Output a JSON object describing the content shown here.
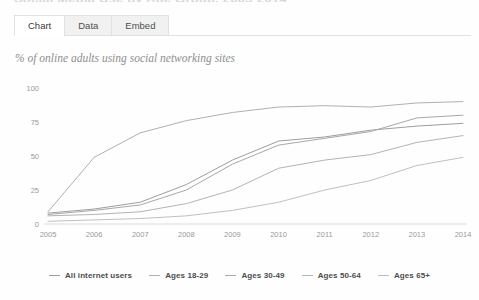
{
  "page": {
    "cut_off_title": "Social Media Use by Age Group, 2005-2014"
  },
  "tabs": [
    {
      "label": "Chart",
      "active": true,
      "name": "tab-chart"
    },
    {
      "label": "Data",
      "active": false,
      "name": "tab-data"
    },
    {
      "label": "Embed",
      "active": false,
      "name": "tab-embed"
    }
  ],
  "subtitle": "% of online adults using social networking sites",
  "colors": {
    "line_all": "#9e9e9e",
    "line_18_29": "#b0b0b0",
    "line_30_49": "#a8a8a8",
    "line_50_64": "#b4b4b4",
    "line_65plus": "#c0c0c0",
    "axis": "#dcdcdc",
    "tick_text": "#9a9a9a"
  },
  "chart_data": {
    "type": "line",
    "title": "",
    "subtitle": "% of online adults using social networking sites",
    "xlabel": "",
    "ylabel": "",
    "x": [
      2005,
      2006,
      2007,
      2008,
      2009,
      2010,
      2011,
      2012,
      2013,
      2014
    ],
    "xtick_labels": [
      "2005",
      "2006",
      "2007",
      "2008",
      "2009",
      "2010",
      "2011",
      "2012",
      "2013",
      "2014"
    ],
    "ytick_labels": [
      "0",
      "25",
      "50",
      "75",
      "100"
    ],
    "yticks": [
      0,
      25,
      50,
      75,
      100
    ],
    "ylim": [
      0,
      100
    ],
    "xlim": [
      2005,
      2014
    ],
    "grid": false,
    "legend_position": "bottom",
    "series": [
      {
        "name": "All internet users",
        "values": [
          8,
          11,
          16,
          29,
          47,
          61,
          64,
          69,
          72,
          74
        ]
      },
      {
        "name": "Ages 18-29",
        "values": [
          9,
          49,
          67,
          76,
          82,
          86,
          87,
          86,
          89,
          90
        ]
      },
      {
        "name": "Ages 30-49",
        "values": [
          7,
          10,
          14,
          25,
          44,
          58,
          63,
          68,
          78,
          80
        ]
      },
      {
        "name": "Ages 50-64",
        "values": [
          6,
          7,
          9,
          15,
          25,
          41,
          47,
          51,
          60,
          65
        ]
      },
      {
        "name": "Ages 65+",
        "values": [
          2,
          3,
          4,
          6,
          10,
          16,
          25,
          32,
          43,
          49
        ]
      }
    ]
  },
  "legend": [
    {
      "label": "All internet users",
      "name": "legend-item-all-internet-users"
    },
    {
      "label": "Ages 18-29",
      "name": "legend-item-ages-18-29"
    },
    {
      "label": "Ages 30-49",
      "name": "legend-item-ages-30-49"
    },
    {
      "label": "Ages 50-64",
      "name": "legend-item-ages-50-64"
    },
    {
      "label": "Ages 65+",
      "name": "legend-item-ages-65-plus"
    }
  ]
}
